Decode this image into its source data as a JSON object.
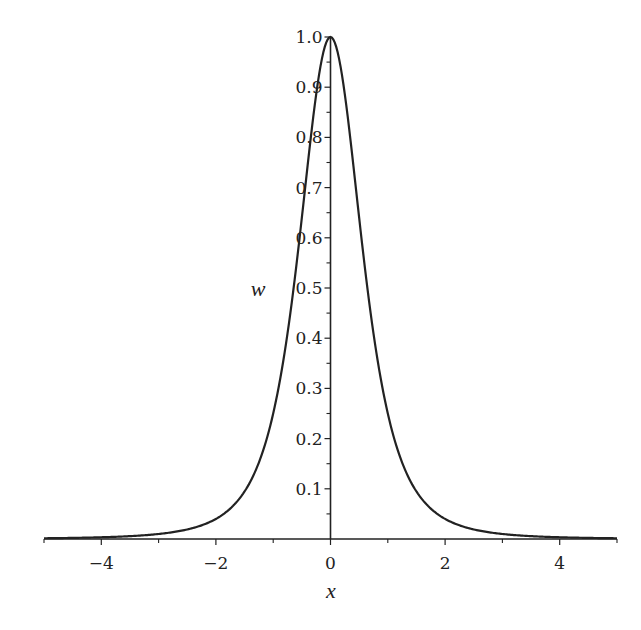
{
  "chart_data": {
    "type": "line",
    "title": "",
    "xlabel": "x",
    "ylabel": "w",
    "xlim": [
      -5,
      5
    ],
    "ylim": [
      0,
      1.0
    ],
    "grid": false,
    "legend": null,
    "x_ticks": [
      "-4",
      "-2",
      "0",
      "2",
      "4"
    ],
    "x_tick_values": [
      -4,
      -2,
      0,
      2,
      4
    ],
    "x_minor_ticks": [
      -5,
      -3,
      -1,
      1,
      3,
      5
    ],
    "y_ticks": [
      "0.1",
      "0.2",
      "0.3",
      "0.4",
      "0.5",
      "0.6",
      "0.7",
      "0.8",
      "0.9",
      "1.0"
    ],
    "y_tick_values": [
      0.1,
      0.2,
      0.3,
      0.4,
      0.5,
      0.6,
      0.7,
      0.8,
      0.9,
      1.0
    ],
    "series": [
      {
        "name": "w(x)",
        "color": "#222222",
        "x": [
          -5,
          -4,
          -3,
          -2,
          -1.5,
          -1,
          -0.75,
          -0.5,
          -0.25,
          0,
          0.25,
          0.5,
          0.75,
          1,
          1.5,
          2,
          3,
          4,
          5
        ],
        "values": [
          0.0015,
          0.0035,
          0.01,
          0.04,
          0.095,
          0.25,
          0.41,
          0.64,
          0.885,
          1.0,
          0.885,
          0.64,
          0.41,
          0.25,
          0.095,
          0.04,
          0.01,
          0.0035,
          0.0015
        ]
      }
    ]
  },
  "colors": {
    "line": "#222222",
    "axis": "#222222",
    "background": "#ffffff"
  }
}
